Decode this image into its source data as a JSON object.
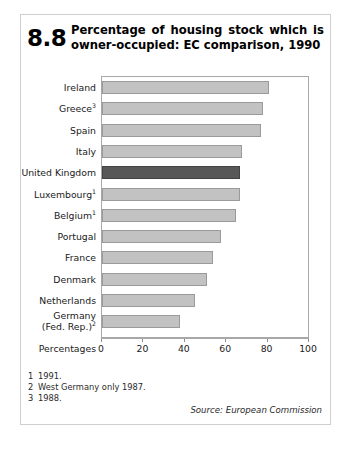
{
  "figure": {
    "number": "8.8",
    "title_line1": "Percentage of housing stock which is",
    "title_line2": "owner-occupied: EC comparison, 1990"
  },
  "chart_data": {
    "type": "bar",
    "orientation": "horizontal",
    "title": "Percentage of housing stock which is owner-occupied: EC comparison, 1990",
    "xlabel": "Percentages",
    "ylabel": "",
    "xlim": [
      0,
      100
    ],
    "ticks": [
      0,
      20,
      40,
      60,
      80,
      100
    ],
    "tick_labels": [
      "0",
      "20",
      "40",
      "60",
      "80",
      "100"
    ],
    "grid": false,
    "legend": "none",
    "highlight_category": "United Kingdom",
    "colors": {
      "bar": "#c2c2c2",
      "bar_border": "#9a9a9a",
      "highlight": "#585858",
      "highlight_border": "#434343",
      "frame": "#a8a8a8"
    },
    "categories": [
      "Ireland",
      "Greece",
      "Spain",
      "Italy",
      "United Kingdom",
      "Luxembourg",
      "Belgium",
      "Portugal",
      "France",
      "Denmark",
      "Netherlands",
      "Germany (Fed. Rep.)"
    ],
    "category_footnote_marks": [
      "",
      "3",
      "",
      "",
      "",
      "1",
      "1",
      "",
      "",
      "",
      "",
      "2"
    ],
    "values": [
      81,
      78,
      77,
      68,
      67,
      67,
      65,
      58,
      54,
      51,
      45,
      38
    ]
  },
  "rows": [
    {
      "label": "Ireland",
      "mark": "",
      "value": 81,
      "highlight": false,
      "two_line": false
    },
    {
      "label": "Greece",
      "mark": "3",
      "value": 78,
      "highlight": false,
      "two_line": false
    },
    {
      "label": "Spain",
      "mark": "",
      "value": 77,
      "highlight": false,
      "two_line": false
    },
    {
      "label": "Italy",
      "mark": "",
      "value": 68,
      "highlight": false,
      "two_line": false
    },
    {
      "label": "United Kingdom",
      "mark": "",
      "value": 67,
      "highlight": true,
      "two_line": false
    },
    {
      "label": "Luxembourg",
      "mark": "1",
      "value": 67,
      "highlight": false,
      "two_line": false
    },
    {
      "label": "Belgium",
      "mark": "1",
      "value": 65,
      "highlight": false,
      "two_line": false
    },
    {
      "label": "Portugal",
      "mark": "",
      "value": 58,
      "highlight": false,
      "two_line": false
    },
    {
      "label": "France",
      "mark": "",
      "value": 54,
      "highlight": false,
      "two_line": false
    },
    {
      "label": "Denmark",
      "mark": "",
      "value": 51,
      "highlight": false,
      "two_line": false
    },
    {
      "label": "Netherlands",
      "mark": "",
      "value": 45,
      "highlight": false,
      "two_line": false
    },
    {
      "label": "Germany",
      "label2": "(Fed. Rep.)",
      "mark": "2",
      "value": 38,
      "highlight": false,
      "two_line": true
    }
  ],
  "axis": {
    "percentages_label": "Percentages",
    "tick_labels": [
      "0",
      "20",
      "40",
      "60",
      "80",
      "100"
    ]
  },
  "footnotes": [
    {
      "num": "1",
      "text": "1991."
    },
    {
      "num": "2",
      "text": "West Germany only 1987."
    },
    {
      "num": "3",
      "text": "1988."
    }
  ],
  "source": "Source: European Commission"
}
